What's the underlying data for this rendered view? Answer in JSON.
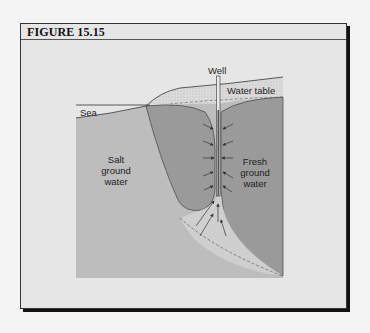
{
  "figure": {
    "title": "FIGURE 15.15"
  },
  "diagram": {
    "labels": {
      "well": "Well",
      "water_table": "Water table",
      "sea": "Sea",
      "salt_line1": "Salt",
      "salt_line2": "ground",
      "salt_line3": "water",
      "fresh_line1": "Fresh",
      "fresh_line2": "ground",
      "fresh_line3": "water"
    },
    "colors": {
      "background": "#e6e6e6",
      "salt_water": "#bdbdbd",
      "fresh_water": "#9a9a9a",
      "unsaturated_zone": "#d8d8d8",
      "transition_zone": "#cfcfcf",
      "lines": "#333333"
    }
  }
}
